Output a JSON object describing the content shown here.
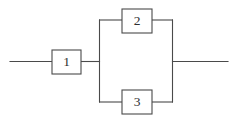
{
  "diagram": {
    "type": "reliability-block-diagram",
    "canvas": {
      "width": 235,
      "height": 119
    },
    "colors": {
      "background": "#ffffff",
      "line": "#4a4a4a",
      "label": "#2e2e2e",
      "block_fill": "#ffffff"
    },
    "blocks": [
      {
        "id": "block-1",
        "label": "1",
        "x": 52,
        "y": 50,
        "width": 29,
        "height": 24,
        "cx": 66.5,
        "cy": 62
      },
      {
        "id": "block-2",
        "label": "2",
        "x": 122,
        "y": 9,
        "width": 30,
        "height": 24,
        "cx": 137,
        "cy": 21
      },
      {
        "id": "block-3",
        "label": "3",
        "x": 122,
        "y": 90,
        "width": 30,
        "height": 24,
        "cx": 137,
        "cy": 102
      }
    ],
    "wires": [
      {
        "id": "lead-left",
        "d": "M 10 61.5 L 52 61.5"
      },
      {
        "id": "wire-block1-to-node",
        "d": "M 81 61.5 L 99.5 61.5"
      },
      {
        "id": "rail-left",
        "d": "M 99.5 20 L 99.5 102"
      },
      {
        "id": "branch-top-left",
        "d": "M 99.5 20 L 122 20"
      },
      {
        "id": "branch-top-right",
        "d": "M 152 20 L 172.5 20"
      },
      {
        "id": "branch-bottom-left",
        "d": "M 99.5 102 L 122 102"
      },
      {
        "id": "branch-bottom-right",
        "d": "M 152 102 L 172.5 102"
      },
      {
        "id": "rail-right",
        "d": "M 172.5 20 L 172.5 102"
      },
      {
        "id": "lead-right",
        "d": "M 172.5 61.5 L 228 61.5"
      }
    ]
  }
}
